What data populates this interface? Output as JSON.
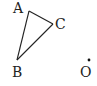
{
  "diagram": {
    "title": "",
    "colors": {
      "stroke": "#222222",
      "background": "#ffffff"
    },
    "points": {
      "A": {
        "label": "A",
        "x": 29,
        "y": 11,
        "label_x": 13,
        "label_y": 13
      },
      "B": {
        "label": "B",
        "x": 17,
        "y": 60,
        "label_x": 12,
        "label_y": 77
      },
      "C": {
        "label": "C",
        "x": 53,
        "y": 24,
        "label_x": 55,
        "label_y": 29
      },
      "O": {
        "label": "O",
        "x": 89,
        "y": 60,
        "label_x": 80,
        "label_y": 77
      }
    },
    "segments": [
      {
        "from": "A",
        "to": "B"
      },
      {
        "from": "A",
        "to": "C"
      },
      {
        "from": "B",
        "to": "C"
      }
    ],
    "dots": [
      "O"
    ]
  }
}
